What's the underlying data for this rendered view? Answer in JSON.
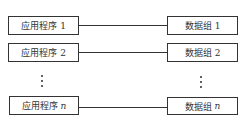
{
  "diagram": {
    "rows": [
      {
        "left": {
          "label": "应用程序",
          "suffix": "1"
        },
        "right": {
          "label": "数据组",
          "suffix": "1"
        }
      },
      {
        "left": {
          "label": "应用程序",
          "suffix": "2"
        },
        "right": {
          "label": "数据组",
          "suffix": "2"
        }
      },
      {
        "left": {
          "label": "应用程序",
          "suffix": "n"
        },
        "right": {
          "label": "数据组",
          "suffix": "n"
        }
      }
    ],
    "ellipsis": "⋮",
    "colors": {
      "stroke": "#333333",
      "background": "#ffffff"
    }
  }
}
